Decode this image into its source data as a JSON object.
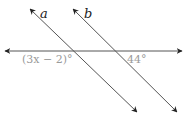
{
  "diagram": {
    "type": "parallel-lines-transversal",
    "lines": [
      {
        "id": "a",
        "label": "a"
      },
      {
        "id": "b",
        "label": "b"
      },
      {
        "id": "transversal",
        "label": ""
      }
    ],
    "angles": [
      {
        "label": "(3x − 2)°",
        "at": "line a intersection, below-left"
      },
      {
        "label": "44°",
        "at": "line b intersection, below-right"
      }
    ],
    "colors": {
      "line": "#333333",
      "angle_text": "#9a9a9a",
      "label_text": "#222222"
    }
  }
}
